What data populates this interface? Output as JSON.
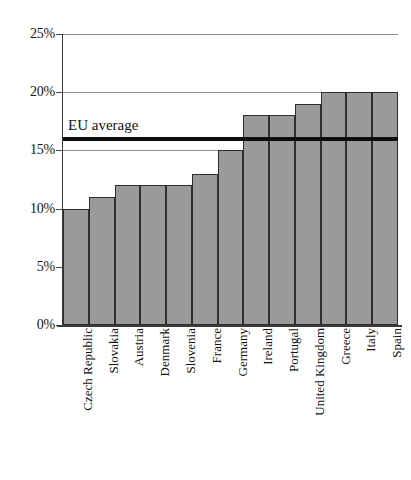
{
  "chart_data": {
    "type": "bar",
    "title": "",
    "subtitle": "",
    "xlabel": "",
    "ylabel": "",
    "ylim": [
      0,
      25
    ],
    "grid": true,
    "legend_position": "none",
    "orientation": "vertical",
    "value_suffix": "%",
    "categories": [
      "Czech Republic",
      "Slovakia",
      "Austria",
      "Denmark",
      "Slovenia",
      "France",
      "Germany",
      "Ireland",
      "Portugal",
      "United Kingdom",
      "Greece",
      "Italy",
      "Spain"
    ],
    "values": [
      10,
      11,
      12,
      12,
      12,
      13,
      15,
      18,
      18,
      19,
      20,
      20,
      20
    ],
    "y_ticks": [
      0,
      5,
      10,
      15,
      20,
      25
    ],
    "y_tick_labels": [
      "0%",
      "5%",
      "10%",
      "15%",
      "20%",
      "25%"
    ],
    "annotations": [
      {
        "name": "eu-average",
        "label": "EU average",
        "value": 16,
        "style": "horizontal-rule"
      }
    ],
    "colors": {
      "bar_fill": "#9a9a9a",
      "bar_stroke": "#2e2e2e",
      "gridline": "#8d8d8d",
      "axis": "#3a3a3a",
      "annotation_line": "#0d0d0d",
      "text": "#121212",
      "background": "#ffffff"
    }
  }
}
